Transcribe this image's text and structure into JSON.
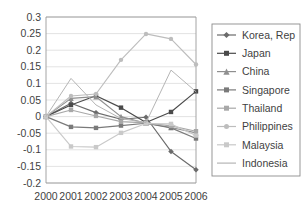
{
  "chart_data": {
    "type": "line",
    "title": "",
    "xlabel": "",
    "ylabel": "",
    "categories": [
      "2000",
      "2001",
      "2002",
      "2003",
      "2004",
      "2005",
      "2006"
    ],
    "ylim": [
      -0.2,
      0.3
    ],
    "ytick_labels": [
      "0.3",
      "0.25",
      "0.2",
      "0.15",
      "0.1",
      "0.05",
      "0",
      "-0.05",
      "-0.1",
      "-0.15",
      "-0.2"
    ],
    "ytick_values": [
      0.3,
      0.25,
      0.2,
      0.15,
      0.1,
      0.05,
      0,
      -0.05,
      -0.1,
      -0.15,
      -0.2
    ],
    "grid": true,
    "legend_position": "right",
    "series": [
      {
        "name": "Korea, Rep",
        "marker": "diamond",
        "color": "#6b6b6b",
        "values": [
          0,
          0.04,
          0.012,
          -0.008,
          -0.002,
          -0.105,
          -0.16
        ]
      },
      {
        "name": "Japan",
        "marker": "square",
        "color": "#4a4a4a",
        "values": [
          0,
          0.035,
          0.063,
          0.027,
          -0.018,
          0.014,
          0.076
        ]
      },
      {
        "name": "China",
        "marker": "triangle",
        "color": "#8f8f8f",
        "values": [
          0,
          0.055,
          0.06,
          0.0,
          -0.02,
          -0.033,
          -0.049
        ]
      },
      {
        "name": "Singapore",
        "marker": "square",
        "color": "#7a7a7a",
        "values": [
          0,
          -0.031,
          -0.034,
          -0.027,
          -0.02,
          -0.034,
          -0.066
        ]
      },
      {
        "name": "Thailand",
        "marker": "square",
        "color": "#a8a8a8",
        "values": [
          0,
          0.02,
          0.002,
          -0.015,
          -0.019,
          -0.028,
          -0.044
        ]
      },
      {
        "name": "Philippines",
        "marker": "circle",
        "color": "#bdbdbd",
        "values": [
          0,
          0.062,
          0.068,
          0.171,
          0.249,
          0.234,
          0.157
        ]
      },
      {
        "name": "Malaysia",
        "marker": "square",
        "color": "#c9c9c9",
        "values": [
          0,
          -0.09,
          -0.092,
          -0.049,
          -0.021,
          -0.022,
          -0.057
        ]
      },
      {
        "name": "Indonesia",
        "marker": "none",
        "color": "#b5b5b5",
        "values": [
          0,
          0.115,
          0.035,
          -0.006,
          -0.018,
          0.14,
          0.075
        ]
      }
    ]
  }
}
